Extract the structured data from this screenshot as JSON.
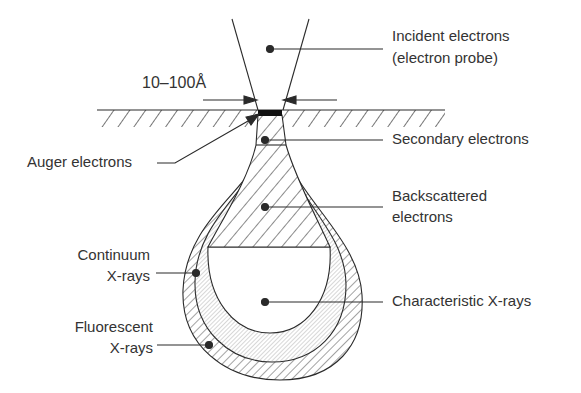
{
  "diagram": {
    "labels": {
      "incident_line1": "Incident electrons",
      "incident_line2": "(electron probe)",
      "probe_size": "10–100Å",
      "auger": "Auger electrons",
      "secondary": "Secondary electrons",
      "backscattered_line1": "Backscattered",
      "backscattered_line2": "electrons",
      "continuum_line1": "Continuum",
      "continuum_line2": "X-rays",
      "characteristic": "Characteristic X-rays",
      "fluorescent_line1": "Fluorescent",
      "fluorescent_line2": "X-rays"
    },
    "colors": {
      "line": "#2a2a2a",
      "text": "#333333",
      "background": "#ffffff",
      "spot": "#111111"
    }
  }
}
